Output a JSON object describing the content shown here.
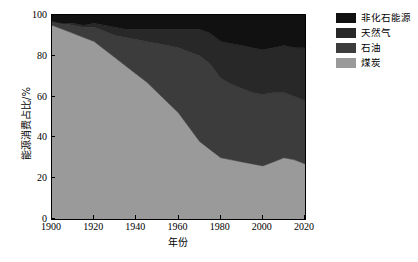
{
  "chart_data": {
    "type": "area",
    "title": "",
    "subtitle": "",
    "xlabel": "年份",
    "ylabel": "能源消费占比/%",
    "xlim": [
      1900,
      2020
    ],
    "ylim": [
      0,
      100
    ],
    "xticks": [
      1900,
      1920,
      1940,
      1960,
      1980,
      2000,
      2020
    ],
    "yticks": [
      0,
      20,
      40,
      60,
      80,
      100
    ],
    "grid": false,
    "stacked": true,
    "stack_order": "bottom-to-top",
    "legend_position": "top-right",
    "x": [
      1900,
      1905,
      1910,
      1915,
      1920,
      1925,
      1930,
      1935,
      1940,
      1945,
      1950,
      1955,
      1960,
      1965,
      1970,
      1975,
      1980,
      1985,
      1990,
      1995,
      2000,
      2005,
      2010,
      2015,
      2020
    ],
    "series": [
      {
        "name": "煤炭",
        "name_en": "coal",
        "color": "#9a9a9a",
        "values": [
          95,
          93,
          91,
          89,
          87,
          83,
          79,
          75,
          71,
          67,
          62,
          57,
          52,
          45,
          38,
          34,
          30,
          29,
          28,
          27,
          26,
          28,
          30,
          29,
          27
        ]
      },
      {
        "name": "石油",
        "name_en": "oil",
        "color": "#3c3c3c",
        "values": [
          2,
          3,
          4,
          5,
          7,
          9,
          11,
          14,
          17,
          20,
          24,
          28,
          32,
          37,
          42,
          42,
          39,
          37,
          36,
          35,
          35,
          34,
          32,
          31,
          31
        ]
      },
      {
        "name": "天然气",
        "name_en": "natural gas",
        "color": "#282828",
        "values": [
          0,
          0,
          1,
          1,
          2,
          3,
          4,
          4,
          5,
          6,
          7,
          8,
          9,
          11,
          13,
          15,
          18,
          20,
          21,
          22,
          22,
          22,
          23,
          24,
          26
        ]
      },
      {
        "name": "非化石能源",
        "name_en": "non-fossil energy",
        "color": "#111111",
        "values": [
          3,
          4,
          4,
          5,
          4,
          5,
          6,
          7,
          7,
          7,
          7,
          7,
          7,
          7,
          7,
          9,
          13,
          14,
          15,
          16,
          17,
          16,
          15,
          16,
          16
        ]
      }
    ]
  },
  "legend": {
    "items": [
      {
        "label": "非化石能源",
        "color": "#111111"
      },
      {
        "label": "天然气",
        "color": "#282828"
      },
      {
        "label": "石油",
        "color": "#3c3c3c"
      },
      {
        "label": "煤炭",
        "color": "#9a9a9a"
      }
    ]
  }
}
